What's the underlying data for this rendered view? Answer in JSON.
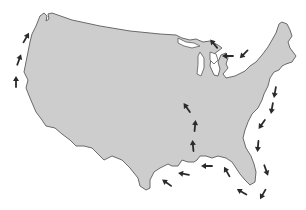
{
  "map": {
    "title": "Map of the United States with route arrows",
    "subject": "Contiguous United States",
    "colors": {
      "land_fill": "#cdcdcd",
      "land_stroke": "#6a6a6a",
      "arrow": "#2a2a2a",
      "background": "#ffffff"
    },
    "outline_path": "M40 16 L44 13 L47 16 L46 21 L49 19 L48 14 L52 13 L72 20 L100 26 L130 31 L160 34 L176 35 L182 38 L190 40 L196 39 L203 42 L210 41 L218 45 L222 48 L214 54 L211 58 L210 66 L214 75 L218 76 L220 69 L218 62 L221 55 L226 53 L228 58 L226 64 L228 68 L223 74 L226 78 L235 76 L245 71 L250 66 L256 62 L262 55 L268 47 L272 40 L276 33 L279 24 L282 22 L287 24 L290 30 L292 36 L288 42 L290 48 L296 56 L292 62 L286 64 L282 66 L279 70 L274 72 L270 78 L268 86 L264 94 L262 100 L258 108 L252 114 L248 122 L245 130 L243 138 L246 148 L251 156 L254 164 L256 172 L255 182 L250 185 L245 180 L240 174 L236 168 L232 162 L226 158 L218 156 L212 158 L206 156 L200 156 L197 160 L194 162 L188 162 L182 160 L178 166 L172 166 L168 164 L160 168 L154 172 L150 180 L150 188 L146 190 L140 186 L138 178 L130 168 L122 160 L112 156 L104 160 L98 154 L92 148 L84 146 L76 146 L70 140 L62 134 L55 128 L46 126 L42 120 L36 112 L30 98 L26 88 L28 80 L24 72 L26 62 L28 52 L30 42 L32 34 L36 26 L40 16 Z",
    "lakes": [
      {
        "name": "lake-superior",
        "path": "M178 38 L186 42 L194 43 L200 46 L192 48 L184 46 L178 43 Z"
      },
      {
        "name": "lake-michigan",
        "path": "M200 52 L204 58 L204 68 L201 76 L197 74 L198 64 L198 56 Z"
      },
      {
        "name": "lake-huron",
        "path": "M210 52 L216 54 L218 60 L214 64 L210 60 Z"
      }
    ],
    "route_arrows": [
      {
        "id": "west-coast-1",
        "x": 16,
        "y": 82,
        "angle": -90
      },
      {
        "id": "west-coast-2",
        "x": 19,
        "y": 60,
        "angle": -70
      },
      {
        "id": "west-coast-3",
        "x": 26,
        "y": 38,
        "angle": -60
      },
      {
        "id": "lakes-1",
        "x": 214,
        "y": 44,
        "angle": -130
      },
      {
        "id": "lakes-2",
        "x": 228,
        "y": 56,
        "angle": 180
      },
      {
        "id": "lakes-3",
        "x": 244,
        "y": 54,
        "angle": 135
      },
      {
        "id": "east-coast-1",
        "x": 275,
        "y": 92,
        "angle": 100
      },
      {
        "id": "east-coast-2",
        "x": 272,
        "y": 108,
        "angle": 100
      },
      {
        "id": "east-coast-3",
        "x": 262,
        "y": 124,
        "angle": 125
      },
      {
        "id": "east-coast-4",
        "x": 258,
        "y": 146,
        "angle": 95
      },
      {
        "id": "florida-1",
        "x": 266,
        "y": 170,
        "angle": 70
      },
      {
        "id": "florida-2",
        "x": 263,
        "y": 194,
        "angle": 120
      },
      {
        "id": "florida-3",
        "x": 242,
        "y": 192,
        "angle": 210
      },
      {
        "id": "gulf-1",
        "x": 227,
        "y": 172,
        "angle": 240
      },
      {
        "id": "gulf-2",
        "x": 207,
        "y": 166,
        "angle": 180
      },
      {
        "id": "gulf-3",
        "x": 184,
        "y": 174,
        "angle": 190
      },
      {
        "id": "gulf-4",
        "x": 167,
        "y": 183,
        "angle": 215
      },
      {
        "id": "mississippi-1",
        "x": 193,
        "y": 146,
        "angle": -95
      },
      {
        "id": "mississippi-2",
        "x": 195,
        "y": 126,
        "angle": -85
      },
      {
        "id": "mississippi-3",
        "x": 187,
        "y": 108,
        "angle": -125
      }
    ]
  }
}
